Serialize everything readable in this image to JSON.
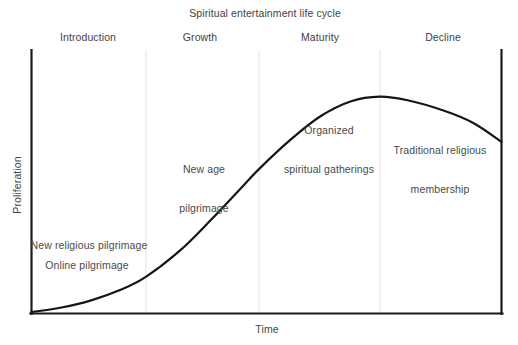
{
  "chart_data": {
    "type": "line",
    "title": "Spiritual entertainment life cycle",
    "xlabel": "Time",
    "ylabel": "Proliferation",
    "grid": false,
    "legend": "none",
    "axis_ticks": "none",
    "xlim": [
      0,
      100
    ],
    "ylim": [
      0,
      100
    ],
    "stages": [
      {
        "label": "Introduction",
        "label_x_pct": 12.1,
        "start_pct": 0.0,
        "end_pct": 24.4
      },
      {
        "label": "Growth",
        "label_x_pct": 35.9,
        "start_pct": 24.4,
        "end_pct": 48.4
      },
      {
        "label": "Maturity",
        "label_x_pct": 61.4,
        "start_pct": 48.4,
        "end_pct": 74.1
      },
      {
        "label": "Decline",
        "label_x_pct": 87.5,
        "start_pct": 74.1,
        "end_pct": 100.0
      }
    ],
    "stage_divider_x_pct": [
      24.4,
      48.4,
      74.1
    ],
    "curve_points": [
      {
        "x": 0.0,
        "y": 0.4
      },
      {
        "x": 6.4,
        "y": 2.3
      },
      {
        "x": 12.7,
        "y": 5.3
      },
      {
        "x": 19.1,
        "y": 9.8
      },
      {
        "x": 24.4,
        "y": 15.2
      },
      {
        "x": 31.8,
        "y": 26.5
      },
      {
        "x": 38.2,
        "y": 39.0
      },
      {
        "x": 44.6,
        "y": 52.3
      },
      {
        "x": 48.4,
        "y": 60.2
      },
      {
        "x": 55.0,
        "y": 72.3
      },
      {
        "x": 61.4,
        "y": 82.2
      },
      {
        "x": 68.0,
        "y": 88.6
      },
      {
        "x": 74.1,
        "y": 90.5
      },
      {
        "x": 80.0,
        "y": 89.0
      },
      {
        "x": 87.5,
        "y": 84.8
      },
      {
        "x": 94.0,
        "y": 79.5
      },
      {
        "x": 100.0,
        "y": 71.6
      }
    ],
    "annotations": [
      {
        "text": "New religious pilgrimage",
        "lines": [
          "New religious pilgrimage"
        ],
        "x_pct": 18.7,
        "y_pct": 26.1
      },
      {
        "text": "Online pilgrimage",
        "lines": [
          "Online pilgrimage"
        ],
        "x_pct": 18.3,
        "y_pct": 18.6
      },
      {
        "text": "New age pilgrimage",
        "lines": [
          "New age",
          "pilgrimage"
        ],
        "x_pct": 38.2,
        "y_pct": 61.0
      },
      {
        "text": "Organized spiritual gatherings",
        "lines": [
          "Organized",
          "spiritual gatherings"
        ],
        "x_pct": 64.1,
        "y_pct": 80.7
      },
      {
        "text": "Traditional religious membership",
        "lines": [
          "Traditional religious",
          "membership"
        ],
        "x_pct": 86.4,
        "y_pct": 70.5
      }
    ],
    "colors": {
      "curve": "#1a1a1a",
      "axis": "#1a1a1a",
      "divider": "#e2e2e2",
      "text": "#454545",
      "background": "#ffffff"
    }
  },
  "chart": {
    "title": "Spiritual entertainment life cycle",
    "xlabel": "Time",
    "ylabel": "Proliferation",
    "stage_labels": [
      "Introduction",
      "Growth",
      "Maturity",
      "Decline"
    ],
    "annotations": [
      {
        "line1": "New religious pilgrimage",
        "line2": ""
      },
      {
        "line1": "Online pilgrimage",
        "line2": ""
      },
      {
        "line1": "New age",
        "line2": "pilgrimage"
      },
      {
        "line1": "Organized",
        "line2": "spiritual gatherings"
      },
      {
        "line1": "Traditional religious",
        "line2": "membership"
      }
    ]
  }
}
